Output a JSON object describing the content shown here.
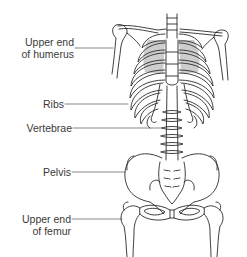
{
  "diagram": {
    "colors": {
      "outline": "#2a2a2a",
      "leader_line": "#555555",
      "shading": "#c8c8c8",
      "label_text": "#3a3a3a",
      "background": "#ffffff"
    },
    "labels": [
      {
        "id": "humerus",
        "line1": "Upper end",
        "line2": "of humerus"
      },
      {
        "id": "ribs",
        "line1": "Ribs"
      },
      {
        "id": "vertebrae",
        "line1": "Vertebrae"
      },
      {
        "id": "pelvis",
        "line1": "Pelvis"
      },
      {
        "id": "femur",
        "line1": "Upper end",
        "line2": "of femur"
      }
    ]
  }
}
